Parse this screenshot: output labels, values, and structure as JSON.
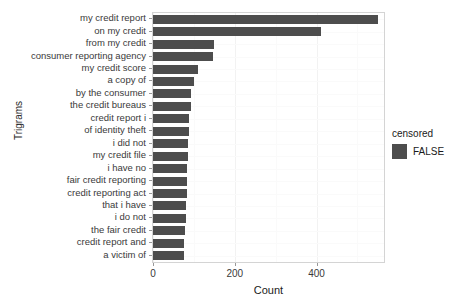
{
  "chart_data": {
    "type": "bar",
    "orientation": "horizontal",
    "title": "",
    "xlabel": "Count",
    "ylabel": "Trigrams",
    "xlim": [
      0,
      565
    ],
    "xticks": [
      0,
      200,
      400
    ],
    "xtick_labels": [
      "0",
      "200",
      "400"
    ],
    "grid": true,
    "legend": {
      "title": "censored",
      "position": "right",
      "entries": [
        {
          "label": "FALSE",
          "color": "#4d4d4d"
        }
      ]
    },
    "bar_color": "#4d4d4d",
    "categories": [
      "my credit report",
      "on my credit",
      "from my credit",
      "consumer reporting agency",
      "my credit score",
      "a copy of",
      "by the consumer",
      "the credit bureaus",
      "credit report i",
      "of identity theft",
      "i did not",
      "my credit file",
      "i have no",
      "fair credit reporting",
      "credit reporting act",
      "that i have",
      "i do not",
      "the fair credit",
      "credit report and",
      "a victim of"
    ],
    "values": [
      551,
      410,
      150,
      146,
      110,
      100,
      93,
      92,
      88,
      87,
      86,
      85,
      84,
      83,
      82,
      81,
      80,
      79,
      76,
      75
    ]
  },
  "legend": {
    "title": "censored",
    "entry_label": "FALSE"
  },
  "axes": {
    "x_title": "Count",
    "y_title": "Trigrams"
  }
}
